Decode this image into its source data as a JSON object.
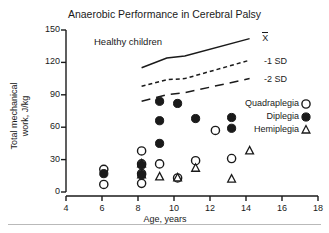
{
  "chart_data": {
    "type": "scatter",
    "title": "Anaerobic Performance in Cerebral Palsy",
    "xlabel": "Age, years",
    "ylabel_line1": "Total mechanical",
    "ylabel_line2": "work, J/kg",
    "xlim": [
      4,
      18
    ],
    "ylim": [
      0,
      150
    ],
    "xticks": [
      4,
      6,
      8,
      10,
      12,
      14,
      16,
      18
    ],
    "yticks": [
      0,
      30,
      60,
      90,
      120,
      150
    ],
    "grid": false,
    "legend_position": "right-inside",
    "annotations": [
      {
        "name": "healthy-children",
        "text": "Healthy  children",
        "x": 7.0,
        "y": 138
      },
      {
        "name": "mean-label",
        "text": "X",
        "x": 14.9,
        "y": 140
      },
      {
        "name": "minus-1sd-label",
        "text": "-1 SD",
        "x": 15.0,
        "y": 120
      },
      {
        "name": "minus-2sd-label",
        "text": "-2 SD",
        "x": 15.0,
        "y": 104
      }
    ],
    "reference_curves": [
      {
        "name": "mean",
        "label": "X",
        "style": "solid",
        "points": [
          [
            8.2,
            115
          ],
          [
            9.6,
            124
          ],
          [
            10.6,
            126
          ],
          [
            14.2,
            142
          ]
        ]
      },
      {
        "name": "minus-1-sd",
        "label": "-1 SD",
        "style": "dashed",
        "points": [
          [
            8.2,
            98
          ],
          [
            9.6,
            104
          ],
          [
            10.6,
            105
          ],
          [
            14.2,
            122
          ]
        ]
      },
      {
        "name": "minus-2-sd",
        "label": "-2 SD",
        "style": "long-dashed",
        "points": [
          [
            8.2,
            84
          ],
          [
            9.6,
            90
          ],
          [
            10.6,
            92
          ],
          [
            14.2,
            105
          ]
        ]
      }
    ],
    "series": [
      {
        "name": "Quadraplegia",
        "marker": "open-circle",
        "points": [
          [
            6.1,
            21
          ],
          [
            6.1,
            7
          ],
          [
            8.2,
            38
          ],
          [
            8.2,
            26
          ],
          [
            8.2,
            17
          ],
          [
            8.2,
            8
          ],
          [
            9.2,
            26
          ],
          [
            10.2,
            13
          ],
          [
            11.2,
            29
          ],
          [
            12.3,
            57
          ],
          [
            13.2,
            31
          ]
        ]
      },
      {
        "name": "Diplegia",
        "marker": "filled-circle",
        "points": [
          [
            6.1,
            17
          ],
          [
            8.2,
            25
          ],
          [
            8.2,
            16
          ],
          [
            9.2,
            84
          ],
          [
            9.2,
            66
          ],
          [
            9.2,
            45
          ],
          [
            10.2,
            82
          ],
          [
            11.2,
            68
          ],
          [
            13.2,
            69
          ],
          [
            13.2,
            59
          ]
        ]
      },
      {
        "name": "Hemiplegia",
        "marker": "triangle",
        "points": [
          [
            8.2,
            26
          ],
          [
            8.2,
            16
          ],
          [
            9.2,
            14
          ],
          [
            10.2,
            13
          ],
          [
            11.2,
            22
          ],
          [
            13.2,
            12
          ],
          [
            14.2,
            38
          ]
        ]
      }
    ]
  },
  "legend": {
    "items": [
      {
        "label": "Quadraplegia",
        "marker": "open-circle"
      },
      {
        "label": "Diplegia",
        "marker": "filled-circle"
      },
      {
        "label": "Hemiplegia",
        "marker": "triangle"
      }
    ]
  },
  "colors": {
    "ink": "#1a1a1a",
    "background": "#ffffff",
    "rule": "#b9b9b9"
  }
}
